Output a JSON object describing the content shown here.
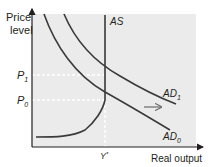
{
  "diagram": {
    "y_axis_label_line1": "Price",
    "y_axis_label_line2": "level",
    "x_axis_label": "Real output",
    "price_ticks": [
      {
        "base": "P",
        "sub": "1"
      },
      {
        "base": "P",
        "sub": "0"
      }
    ],
    "output_tick": {
      "base": "Y",
      "sup": "*"
    },
    "curves": {
      "as": {
        "label": "AS"
      },
      "ad1": {
        "base": "AD",
        "sub": "1"
      },
      "ad0": {
        "base": "AD",
        "sub": "0"
      }
    },
    "shift_arrow": {
      "direction": "right"
    },
    "colors": {
      "plot_background": "#ebebeb",
      "curve": "#3a3a3a",
      "axis": "#231f20",
      "guide": "#ffffff"
    }
  }
}
